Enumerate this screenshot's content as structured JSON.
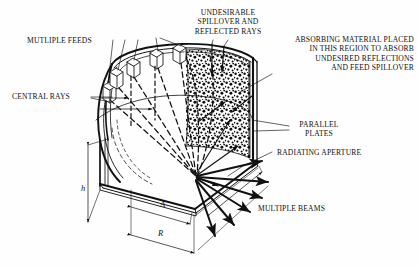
{
  "figure": {
    "name": "parallel-plate-pillbox-lens-antenna-cutaway",
    "background": "#fefefe",
    "ink": "#111111",
    "width": 418,
    "height": 266
  },
  "labels": {
    "multiple_feeds": "MUTLIPLE FEEDS",
    "central_rays": "CENTRAL RAYS",
    "undesirable_spillover": "UNDESIRABLE\nSPILLOVER AND\nREFLECTED RAYS",
    "absorbing_material": "ABSORBING MATERIAL PLACED\nIN THIS REGION TO ABSORB\nUNDESIRED REFLECTIONS\nAND FEED SPILLOVER",
    "parallel_plates": "PARALLEL\nPLATES",
    "radiating_aperture": "RADIATING APERTURE",
    "multiple_beams": "MULTIPLE BEAMS"
  },
  "dimensions": {
    "height_symbol": "h",
    "aperture_symbol": "A",
    "radius_symbol": "R"
  }
}
